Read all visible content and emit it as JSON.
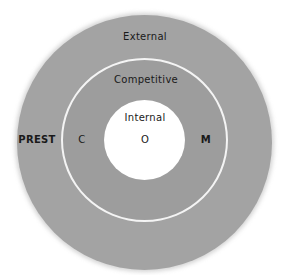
{
  "diagram": {
    "type": "concentric-circles",
    "colors": {
      "outer_ring": "#a3a3a3",
      "middle_ring": "#9d9d9d",
      "divider": "#f4f4f4",
      "inner_circle": "#ffffff",
      "text": "#1a1a1a"
    },
    "rings": [
      {
        "name": "External",
        "label": "External",
        "side_label": "PREST"
      },
      {
        "name": "Competitive",
        "label": "Competitive",
        "left_label": "C",
        "right_label": "M"
      },
      {
        "name": "Internal",
        "label": "Internal",
        "center_label": "O"
      }
    ]
  }
}
